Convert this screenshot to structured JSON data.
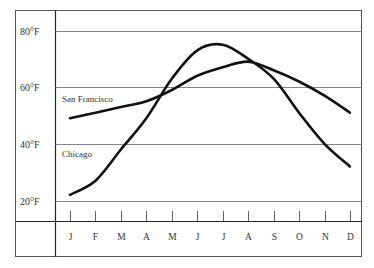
{
  "chart_data": {
    "type": "line",
    "title": "",
    "xlabel": "",
    "ylabel": "",
    "categories": [
      "J",
      "F",
      "M",
      "A",
      "M",
      "J",
      "J",
      "A",
      "S",
      "O",
      "N",
      "D"
    ],
    "y_ticks": [
      "20°F",
      "40°F",
      "60°F",
      "80°F"
    ],
    "y_tick_values": [
      20,
      40,
      60,
      80
    ],
    "ylim": [
      16,
      87
    ],
    "grid": true,
    "legend_position": "inline labels",
    "series": [
      {
        "name": "San Francisco",
        "values": [
          49,
          51,
          53,
          55,
          59,
          64,
          67,
          69,
          66,
          62,
          57,
          51
        ]
      },
      {
        "name": "Chicago",
        "values": [
          22,
          27,
          38,
          49,
          63,
          73,
          75,
          70,
          63,
          51,
          40,
          32
        ]
      }
    ]
  }
}
